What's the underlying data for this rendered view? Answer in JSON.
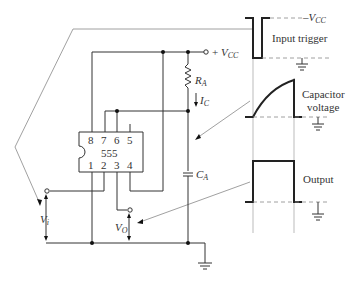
{
  "figure": {
    "ic": {
      "name": "555",
      "top_pins": [
        "8",
        "7",
        "6",
        "5"
      ],
      "bottom_pins": [
        "1",
        "2",
        "3",
        "4"
      ]
    },
    "components": {
      "supply": {
        "prefix": "+ ",
        "main": "V",
        "sub": "CC"
      },
      "resistor": {
        "main": "R",
        "sub": "A"
      },
      "current": {
        "main": "I",
        "sub": "C"
      },
      "capacitor": {
        "main": "C",
        "sub": "A"
      },
      "input_voltage": {
        "main": "V",
        "sub": "i"
      },
      "output_voltage": {
        "main": "V",
        "sub": "O"
      }
    },
    "waveforms": {
      "vcc_level": {
        "prefix": "–",
        "main": "V",
        "sub": "CC"
      },
      "input_trigger": "Input trigger",
      "capacitor_voltage_line1": "Capacitor",
      "capacitor_voltage_line2": "voltage",
      "output": "Output"
    }
  }
}
